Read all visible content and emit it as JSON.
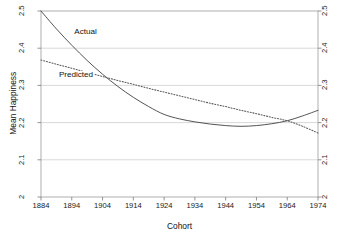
{
  "chart_data": {
    "type": "line",
    "title": "",
    "xlabel": "Cohort",
    "ylabel": "Mean Happiness",
    "xlim": [
      1884,
      1974
    ],
    "ylim": [
      2,
      2.5
    ],
    "grid": true,
    "grid_axis": "y",
    "legend_position": "inline-annotations",
    "x_ticks": [
      1884,
      1894,
      1904,
      1914,
      1924,
      1934,
      1944,
      1954,
      1964,
      1974
    ],
    "y_ticks": [
      2,
      2.1,
      2.2,
      2.3,
      2.4,
      2.5
    ],
    "y_ticks_labels": [
      "2",
      "2.1",
      "2.2",
      "2.3",
      "2.4",
      "2.5"
    ],
    "right_axis_mirrored": true,
    "x": [
      1884,
      1889,
      1894,
      1899,
      1904,
      1909,
      1914,
      1919,
      1924,
      1929,
      1934,
      1939,
      1944,
      1949,
      1954,
      1959,
      1964,
      1969,
      1974
    ],
    "series": [
      {
        "name": "Actual",
        "style": "solid",
        "color": "#4a4a4a",
        "values": [
          2.5,
          2.452,
          2.408,
          2.367,
          2.33,
          2.297,
          2.268,
          2.243,
          2.222,
          2.21,
          2.202,
          2.196,
          2.192,
          2.19,
          2.192,
          2.197,
          2.205,
          2.218,
          2.233
        ]
      },
      {
        "name": "Predicted",
        "style": "dotted",
        "color": "#5a5a5a",
        "values": [
          2.368,
          2.357,
          2.346,
          2.335,
          2.324,
          2.313,
          2.303,
          2.292,
          2.282,
          2.272,
          2.262,
          2.252,
          2.243,
          2.233,
          2.224,
          2.214,
          2.205,
          2.19,
          2.172
        ]
      }
    ],
    "annotations": [
      {
        "text": "Actual",
        "x": 1894.5,
        "y": 2.44
      },
      {
        "text": "Predicted",
        "x": 1889.5,
        "y": 2.325
      }
    ]
  },
  "axes": {
    "x_title": "Cohort",
    "y_title": "Mean Happiness"
  }
}
